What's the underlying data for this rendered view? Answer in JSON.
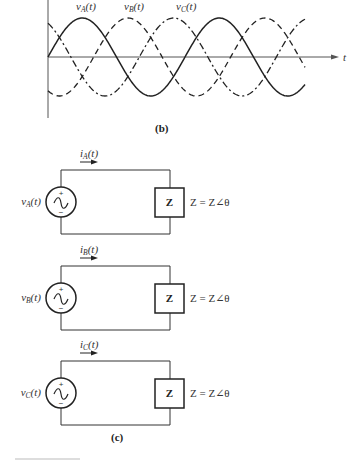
{
  "figure_b": {
    "caption": "(b)",
    "axis_label": "t",
    "labels": {
      "vA": {
        "main": "v",
        "sub": "A",
        "arg": "(t)"
      },
      "vB": {
        "main": "v",
        "sub": "B",
        "arg": "(t)"
      },
      "vC": {
        "main": "v",
        "sub": "C",
        "arg": "(t)"
      }
    },
    "waveforms": [
      {
        "name": "vA(t)",
        "style": "solid",
        "phase_deg": 0
      },
      {
        "name": "vB(t)",
        "style": "dashed",
        "phase_deg": -120
      },
      {
        "name": "vC(t)",
        "style": "dash-dot",
        "phase_deg": 120
      }
    ]
  },
  "figure_c": {
    "caption": "(c)",
    "circuits": [
      {
        "source": {
          "main": "v",
          "sub": "A",
          "arg": "(t)"
        },
        "current": {
          "main": "i",
          "sub": "A",
          "arg": "(t)"
        },
        "load": "Z",
        "load_eq": "Z = Z∠θ",
        "plus": "+",
        "minus": "−"
      },
      {
        "source": {
          "main": "v",
          "sub": "B",
          "arg": "(t)"
        },
        "current": {
          "main": "i",
          "sub": "B",
          "arg": "(t)"
        },
        "load": "Z",
        "load_eq": "Z = Z∠θ",
        "plus": "+",
        "minus": "−"
      },
      {
        "source": {
          "main": "v",
          "sub": "C",
          "arg": "(t)"
        },
        "current": {
          "main": "i",
          "sub": "C",
          "arg": "(t)"
        },
        "load": "Z",
        "load_eq": "Z = Z∠θ",
        "plus": "+",
        "minus": "−"
      }
    ]
  },
  "colors": {
    "line": "#222222",
    "axis": "#555555",
    "background": "#ffffff"
  }
}
